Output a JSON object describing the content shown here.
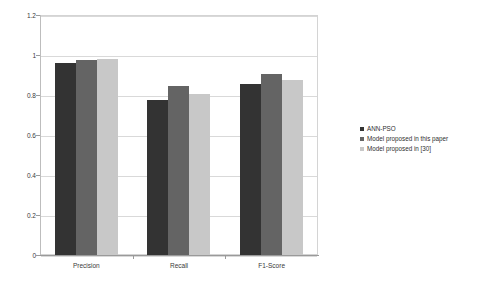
{
  "chart_data": {
    "type": "bar",
    "title": "",
    "subtitle": "",
    "xlabel": "",
    "ylabel": "",
    "categories": [
      "Precision",
      "Recall",
      "F1-Score"
    ],
    "ylim": [
      0,
      1.2
    ],
    "ytick_labels": [
      "0",
      "0.2",
      "0.4",
      "0.6",
      "0.8",
      "1",
      "1.2"
    ],
    "ytick_values": [
      0,
      0.2,
      0.4,
      0.6,
      0.8,
      1,
      1.2
    ],
    "grid": true,
    "legend_position": "right",
    "series": [
      {
        "name": "ANN-PSO",
        "color": "#333333",
        "values": [
          0.96,
          0.775,
          0.855
        ]
      },
      {
        "name": "Model proposed in this paper",
        "color": "#646464",
        "values": [
          0.975,
          0.845,
          0.905
        ]
      },
      {
        "name": "Model proposed in [30]",
        "color": "#c8c8c8",
        "values": [
          0.98,
          0.805,
          0.875
        ]
      }
    ]
  },
  "style": {
    "plot_background": "#ffffff",
    "gridline_color": "#d9d9d9",
    "axis_color": "#9a9a9a",
    "text_color": "#3a3a3a"
  }
}
